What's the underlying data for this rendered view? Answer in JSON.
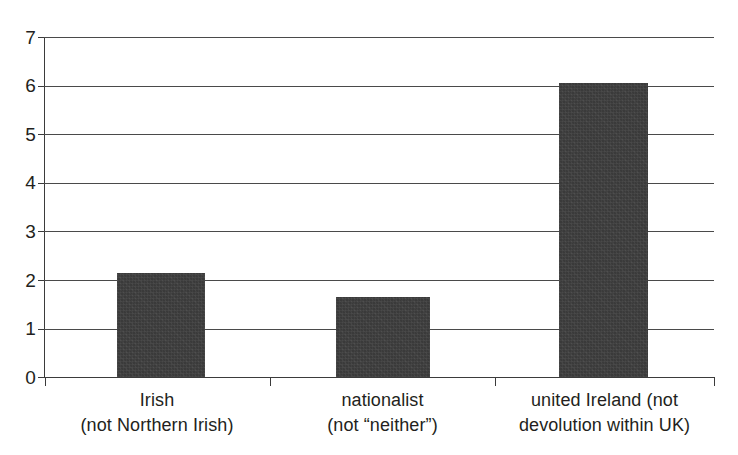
{
  "chart_data": {
    "type": "bar",
    "title": "",
    "subtitle": "",
    "xlabel": "",
    "ylabel": "",
    "ylim": [
      0,
      7
    ],
    "yticks": [
      "0",
      "1",
      "2",
      "3",
      "4",
      "5",
      "6",
      "7"
    ],
    "grid": true,
    "legend": null,
    "bar_color": "#3a3a3a",
    "axis_color": "#3b3b3b",
    "background_color": "#ffffff",
    "categories": [
      "Irish (not Northern Irish)",
      "nationalist (not “neither”)",
      "united Ireland (not devolution within UK)"
    ],
    "category_lines": [
      {
        "line1": "Irish",
        "line2": "(not Northern Irish)"
      },
      {
        "line1": "nationalist",
        "line2": "(not “neither”)"
      },
      {
        "line1": "united Ireland (not",
        "line2": "devolution within UK)"
      }
    ],
    "values": [
      2.15,
      1.65,
      6.05
    ],
    "series": [
      {
        "name": "",
        "values": [
          2.15,
          1.65,
          6.05
        ]
      }
    ]
  }
}
